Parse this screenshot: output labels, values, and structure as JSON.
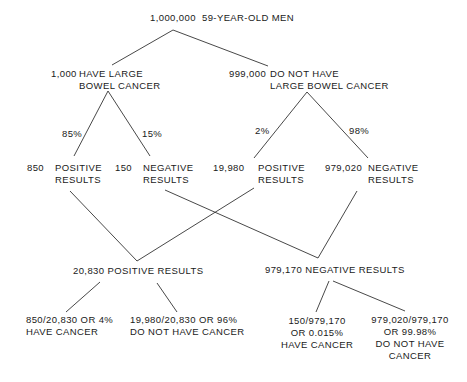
{
  "root": {
    "count": "1,000,000",
    "label": "59-YEAR-OLD MEN"
  },
  "level1": {
    "cancer": {
      "count": "1,000",
      "line1": "HAVE LARGE",
      "line2": "BOWEL CANCER"
    },
    "no_cancer": {
      "count": "999,000",
      "line1": "DO NOT HAVE",
      "line2": "LARGE BOWEL CANCER"
    }
  },
  "rates": {
    "cancer_positive": "85%",
    "cancer_negative": "15%",
    "no_cancer_positive": "2%",
    "no_cancer_negative": "98%"
  },
  "level2": {
    "cancer_positive": {
      "count": "850",
      "line1": "POSITIVE",
      "line2": "RESULTS"
    },
    "cancer_negative": {
      "count": "150",
      "line1": "NEGATIVE",
      "line2": "RESULTS"
    },
    "no_cancer_positive": {
      "count": "19,980",
      "line1": "POSITIVE",
      "line2": "RESULTS"
    },
    "no_cancer_negative": {
      "count": "979,020",
      "line1": "NEGATIVE",
      "line2": "RESULTS"
    }
  },
  "totals": {
    "positive": "20,830 POSITIVE RESULTS",
    "negative": "979,170 NEGATIVE RESULTS"
  },
  "outcomes": {
    "pos_have": {
      "line1": "850/20,830 OR 4%",
      "line2": "HAVE CANCER"
    },
    "pos_not": {
      "line1": "19,980/20,830 OR 96%",
      "line2": "DO NOT HAVE CANCER"
    },
    "neg_have": {
      "line1": "150/979,170",
      "line2": "OR 0.015%",
      "line3": "HAVE CANCER"
    },
    "neg_not": {
      "line1": "979,020/979,170",
      "line2": "OR 99.98%",
      "line3": "DO NOT HAVE",
      "line4": "CANCER"
    }
  }
}
